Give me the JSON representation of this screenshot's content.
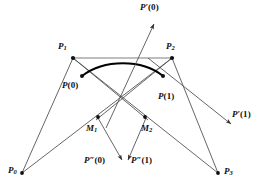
{
  "figure": {
    "background_color": "#ffffff",
    "line_color": "#4a4a4a",
    "curve_color": "#000000",
    "chord_color": "#a8a8a8",
    "point_color": "#101010",
    "label_color": "#101010"
  },
  "labels": {
    "p0": {
      "base": "P",
      "sub": "0",
      "prime": "",
      "arg": ""
    },
    "p1": {
      "base": "P",
      "sub": "1",
      "prime": "",
      "arg": ""
    },
    "p2": {
      "base": "P",
      "sub": "2",
      "prime": "",
      "arg": ""
    },
    "p3": {
      "base": "P",
      "sub": "3",
      "prime": "",
      "arg": ""
    },
    "pt0": {
      "base": "P",
      "sub": "",
      "prime": "",
      "arg": "(0)"
    },
    "pt1": {
      "base": "P",
      "sub": "",
      "prime": "",
      "arg": "(1)"
    },
    "m1": {
      "base": "M",
      "sub": "1",
      "prime": "",
      "arg": ""
    },
    "m2": {
      "base": "M",
      "sub": "2",
      "prime": "",
      "arg": ""
    },
    "dp0": {
      "base": "P",
      "sub": "",
      "prime": "′",
      "arg": "(0)"
    },
    "dp1": {
      "base": "P",
      "sub": "",
      "prime": "′",
      "arg": "(1)"
    },
    "ddp0": {
      "base": "P",
      "sub": "",
      "prime": "″",
      "arg": "(0)"
    },
    "ddp1": {
      "base": "P",
      "sub": "",
      "prime": "″",
      "arg": "(1)"
    }
  },
  "points": [
    {
      "name": "P0",
      "x": 22,
      "y": 173
    },
    {
      "name": "P1",
      "x": 73,
      "y": 58
    },
    {
      "name": "P2",
      "x": 172,
      "y": 58
    },
    {
      "name": "P3",
      "x": 218,
      "y": 173
    },
    {
      "name": "P(0)",
      "x": 82,
      "y": 76
    },
    {
      "name": "P(1)",
      "x": 163,
      "y": 76
    },
    {
      "name": "M1",
      "x": 98,
      "y": 117
    },
    {
      "name": "M2",
      "x": 145,
      "y": 117
    }
  ],
  "label_positions": {
    "p0": {
      "x": 8,
      "y": 166
    },
    "p1": {
      "x": 58,
      "y": 42
    },
    "p2": {
      "x": 166,
      "y": 42
    },
    "p3": {
      "x": 224,
      "y": 167
    },
    "pt0": {
      "x": 62,
      "y": 81
    },
    "pt1": {
      "x": 158,
      "y": 92
    },
    "m1": {
      "x": 86,
      "y": 124
    },
    "m2": {
      "x": 141,
      "y": 124
    },
    "dp0": {
      "x": 140,
      "y": 3
    },
    "dp1": {
      "x": 232,
      "y": 110
    },
    "ddp0": {
      "x": 84,
      "y": 156
    },
    "ddp1": {
      "x": 131,
      "y": 156
    }
  },
  "segments": [
    {
      "name": "p1-p2-chord",
      "from": "P1",
      "to": "P2",
      "style": "chord"
    },
    {
      "name": "p0-p1-leg",
      "from": "P0",
      "to": "P1",
      "style": "thin"
    },
    {
      "name": "p2-p3-leg",
      "from": "P2",
      "to": "P3",
      "style": "thin"
    },
    {
      "name": "p1-m1",
      "from": "P1",
      "to": "M1",
      "style": "thin"
    },
    {
      "name": "p2-m2",
      "from": "P2",
      "to": "M2",
      "style": "thin"
    },
    {
      "name": "p0-to-p2",
      "from": "P0",
      "to": "P2",
      "style": "thin"
    },
    {
      "name": "p1-to-p3",
      "from": "P1",
      "to": "P3",
      "style": "thin"
    },
    {
      "name": "p1-m2",
      "from": "P1",
      "to": "M2",
      "style": "thin"
    },
    {
      "name": "p2-m1",
      "from": "P2",
      "to": "M1",
      "style": "thin"
    }
  ],
  "arrows": [
    {
      "name": "first-derivative-at-zero",
      "label": "dp0",
      "x1": 108,
      "y1": 125,
      "x2": 156,
      "y2": 22
    },
    {
      "name": "first-derivative-at-one",
      "label": "dp1",
      "x1": 150,
      "y1": 60,
      "x2": 233,
      "y2": 125
    },
    {
      "name": "second-derivative-at-zero",
      "label": "ddp0",
      "x1": 98,
      "y1": 118,
      "x2": 123,
      "y2": 162
    },
    {
      "name": "second-derivative-at-one",
      "label": "ddp1",
      "x1": 146,
      "y1": 118,
      "x2": 127,
      "y2": 162
    }
  ],
  "curve": {
    "name": "bezier-curve",
    "start": {
      "x": 82,
      "y": 76
    },
    "control1": {
      "x": 104,
      "y": 59
    },
    "control2": {
      "x": 142,
      "y": 59
    },
    "end": {
      "x": 163,
      "y": 76
    }
  }
}
